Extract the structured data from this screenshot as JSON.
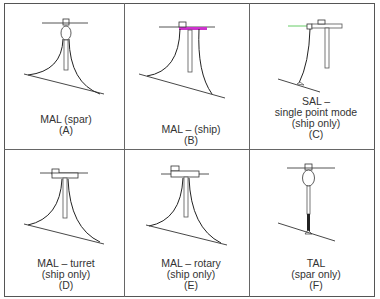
{
  "figure": {
    "panels": [
      {
        "id": "A",
        "lines": [
          "MAL (spar)",
          "(A)"
        ],
        "type": "MAL spar"
      },
      {
        "id": "B",
        "lines": [
          "MAL – (ship)",
          "(B)"
        ],
        "type": "MAL ship",
        "accent": "#cc33cc"
      },
      {
        "id": "C",
        "lines": [
          "SAL –",
          "single point mode",
          "(ship only)",
          "(C)"
        ],
        "type": "SAL",
        "accent": "#66cc66"
      },
      {
        "id": "D",
        "lines": [
          "MAL – turret",
          "(ship only)",
          "(D)"
        ],
        "type": "MAL turret"
      },
      {
        "id": "E",
        "lines": [
          "MAL – rotary",
          "(ship only)",
          "(E)"
        ],
        "type": "MAL rotary"
      },
      {
        "id": "F",
        "lines": [
          "TAL",
          "(spar only)",
          "(F)"
        ],
        "type": "TAL"
      }
    ]
  },
  "colors": {
    "line": "#222222",
    "border": "#666666",
    "magenta": "#cc33cc",
    "green": "#66cc66"
  }
}
